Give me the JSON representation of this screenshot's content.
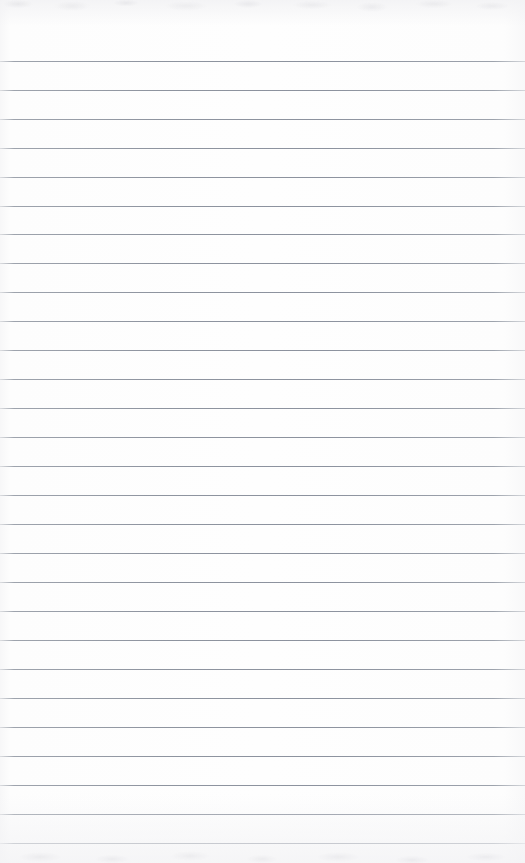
{
  "document": {
    "kind": "scanned-notebook-page",
    "title": "Blank ruled notebook page",
    "description": "A scanned blank sheet of wide-ruled lined notebook paper. No handwriting, printed text, headings, page numbers or margin rule are present.",
    "width": 525,
    "height": 863,
    "orientation": "portrait",
    "text_content": "",
    "has_handwriting": false,
    "has_printed_text": false,
    "has_margin_rule": false,
    "has_page_number": false,
    "has_holes": false
  },
  "paper": {
    "background_color": "#fefefe",
    "edge_tint_color": "#f7f7f8",
    "top_band_color": "#f2f2f4",
    "bottom_band_color": "#f3f3f5"
  },
  "ruling": {
    "line_color": "#8e94a0",
    "line_color_light": "#a8adb5",
    "line_count": 28,
    "first_line_y": 61,
    "line_spacing": 28.95,
    "line_thickness": 1,
    "line_start_x": 0,
    "line_end_x": 525,
    "line_y_positions": [
      61,
      90,
      119,
      148,
      177,
      206,
      234,
      263,
      292,
      321,
      350,
      379,
      408,
      437,
      466,
      495,
      524,
      553,
      582,
      611,
      640,
      669,
      698,
      727,
      756,
      785,
      814,
      843
    ]
  }
}
